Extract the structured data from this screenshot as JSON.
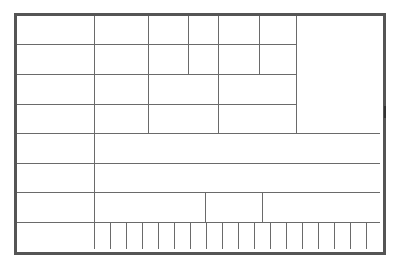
{
  "grid": {
    "description": "Blank ruled table form",
    "border_color": "#555555",
    "line_color": "#6a6a6a",
    "rows": 8,
    "bottom_row_cells": 18
  }
}
